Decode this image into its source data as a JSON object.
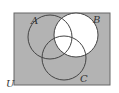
{
  "diagram": {
    "type": "venn",
    "universe_label": "U",
    "sets": [
      {
        "label": "A"
      },
      {
        "label": "B"
      },
      {
        "label": "C"
      }
    ],
    "shaded_regions": [
      "outside all sets",
      "A only",
      "C only",
      "A and C not B"
    ],
    "unshaded_regions": [
      "B only",
      "A and B not C",
      "B and C not A",
      "A and B and C"
    ],
    "colors": {
      "shade": "#b3b3b3",
      "unshaded": "#ffffff",
      "stroke": "#444444"
    }
  }
}
